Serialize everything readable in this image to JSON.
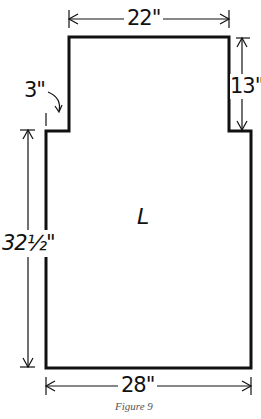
{
  "figure": {
    "caption": "Figure 9",
    "piece_label": "L",
    "dimensions": {
      "top_width": "22\"",
      "upper_height": "13\"",
      "step_offset": "3\"",
      "lower_height": "32½\"",
      "bottom_width": "28\""
    }
  },
  "colors": {
    "line": "#111111",
    "background": "#ffffff",
    "caption": "#555555"
  }
}
